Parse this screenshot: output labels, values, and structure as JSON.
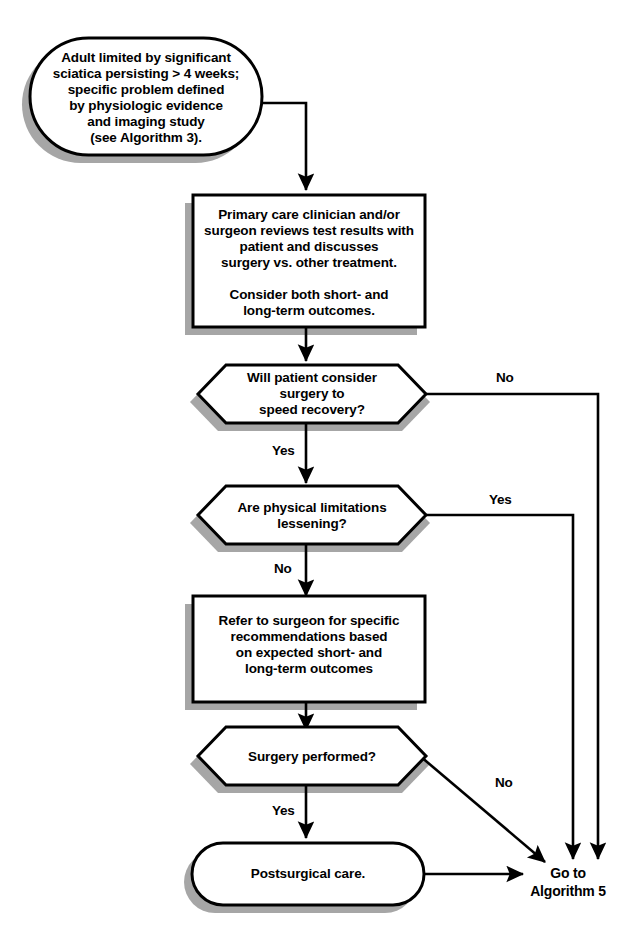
{
  "diagram": {
    "colors": {
      "stroke": "#000000",
      "fill": "#ffffff",
      "shadow": "#a6a6a6",
      "text": "#000000"
    }
  },
  "nodes": {
    "start": {
      "shape": "rounded-terminal",
      "text": "Adult limited by significant\nsciatica persisting > 4 weeks;\nspecific problem defined\nby physiologic evidence\nand imaging study\n(see Algorithm 3)."
    },
    "review": {
      "shape": "process",
      "text": "Primary care clinician and/or\nsurgeon reviews test results with\npatient and discusses\nsurgery vs. other treatment.\n\nConsider both short- and\nlong-term outcomes."
    },
    "consider_surgery": {
      "shape": "decision",
      "text": "Will patient consider\nsurgery to\nspeed recovery?"
    },
    "limitations": {
      "shape": "decision",
      "text": "Are physical limitations\nlessening?"
    },
    "refer": {
      "shape": "process",
      "text": "Refer to surgeon for specific\nrecommendations based\non expected short- and\nlong-term outcomes"
    },
    "surgery_performed": {
      "shape": "decision",
      "text": "Surgery performed?"
    },
    "postsurgical": {
      "shape": "rounded-terminal",
      "text": "Postsurgical care."
    },
    "goto": {
      "shape": "label",
      "text": "Go to\nAlgorithm 5"
    }
  },
  "edge_labels": {
    "consider_surgery_no": "No",
    "consider_surgery_yes": "Yes",
    "limitations_yes": "Yes",
    "limitations_no": "No",
    "surgery_no": "No",
    "surgery_yes": "Yes"
  }
}
